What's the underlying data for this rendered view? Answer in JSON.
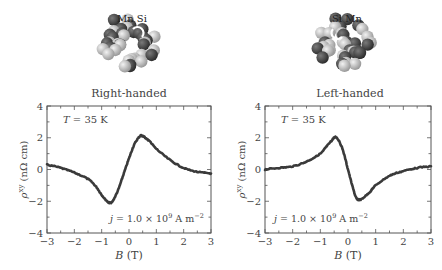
{
  "figure": {
    "panels": [
      {
        "title": "Right-handed",
        "structure_label": "Mn Si",
        "temperature_label": "T = 35 K",
        "current_label": "j = 1.0 × 10⁹ A m⁻²"
      },
      {
        "title": "Left-handed",
        "structure_label": "Si Mn",
        "temperature_label": "T = 35 K",
        "current_label": "j = 1.0 × 10⁹ A m⁻²"
      }
    ]
  },
  "chart_data": [
    {
      "type": "line",
      "title": "Right-handed",
      "xlabel": "B (T)",
      "ylabel": "ρ^xy (nΩ cm)",
      "xlim": [
        -3,
        3
      ],
      "ylim": [
        -4,
        4
      ],
      "xticks": [
        -3,
        -2,
        -1,
        0,
        1,
        2,
        3
      ],
      "yticks": [
        -4,
        -2,
        0,
        2,
        4
      ],
      "annotations": [
        "T = 35 K",
        "j = 1.0 × 10^9 A m^-2"
      ],
      "grid": false,
      "series": [
        {
          "name": "Right-handed",
          "x": [
            -3.0,
            -2.5,
            -2.0,
            -1.5,
            -1.2,
            -1.0,
            -0.8,
            -0.7,
            -0.6,
            -0.4,
            -0.2,
            0.0,
            0.2,
            0.4,
            0.5,
            0.6,
            0.8,
            1.0,
            1.5,
            2.0,
            2.5,
            3.0
          ],
          "y": [
            0.3,
            0.1,
            -0.2,
            -0.6,
            -1.1,
            -1.6,
            -2.0,
            -2.1,
            -2.0,
            -1.3,
            -0.3,
            0.7,
            1.6,
            2.1,
            2.1,
            2.0,
            1.7,
            1.3,
            0.6,
            0.1,
            -0.15,
            -0.25
          ]
        }
      ]
    },
    {
      "type": "line",
      "title": "Left-handed",
      "xlabel": "B (T)",
      "ylabel": "ρ^xy (nΩ cm)",
      "xlim": [
        -3,
        3
      ],
      "ylim": [
        -4,
        4
      ],
      "xticks": [
        -3,
        -2,
        -1,
        0,
        1,
        2,
        3
      ],
      "yticks": [
        -4,
        -2,
        0,
        2,
        4
      ],
      "annotations": [
        "T = 35 K",
        "j = 1.0 × 10^9 A m^-2"
      ],
      "grid": false,
      "series": [
        {
          "name": "Left-handed",
          "x": [
            -3.0,
            -2.5,
            -2.0,
            -1.5,
            -1.0,
            -0.8,
            -0.6,
            -0.5,
            -0.4,
            -0.2,
            0.0,
            0.2,
            0.3,
            0.4,
            0.5,
            0.8,
            1.0,
            1.5,
            2.0,
            2.5,
            3.0
          ],
          "y": [
            0.0,
            0.1,
            0.2,
            0.5,
            1.0,
            1.4,
            1.8,
            2.0,
            2.0,
            1.3,
            0.0,
            -1.3,
            -1.8,
            -1.9,
            -1.85,
            -1.4,
            -1.0,
            -0.4,
            -0.1,
            0.1,
            0.2
          ]
        }
      ]
    }
  ]
}
